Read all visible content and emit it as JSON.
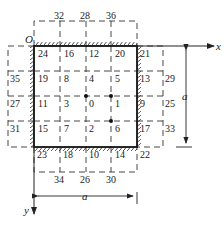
{
  "diagram": {
    "origin_label": "O",
    "x_axis_label": "x",
    "y_axis_label": "y",
    "dimension_horizontal": "a",
    "dimension_vertical": "a",
    "top_labels": [
      "32",
      "28",
      "36"
    ],
    "bottom_labels": [
      "34",
      "26",
      "30"
    ],
    "left_labels": [
      "35",
      "27",
      "31"
    ],
    "right_labels": [
      "29",
      "25",
      "33"
    ],
    "grid_rows": [
      [
        "24",
        "16",
        "12",
        "20",
        "21"
      ],
      [
        "19",
        "8",
        "4",
        "5",
        "13"
      ],
      [
        "11",
        "3",
        "0",
        "1",
        "9"
      ],
      [
        "15",
        "7",
        "2",
        "6",
        "17"
      ],
      [
        "23",
        "18",
        "10",
        "14",
        "22"
      ]
    ],
    "colors": {
      "line": "#222222",
      "background": "#ffffff"
    }
  }
}
